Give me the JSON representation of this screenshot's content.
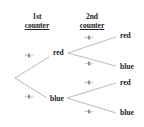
{
  "headers": {
    "first": [
      "1st",
      "counter"
    ],
    "second": [
      "2nd",
      "counter"
    ]
  },
  "nodes": {
    "first_red": "red",
    "first_blue": "blue",
    "red_red": "red",
    "red_blue": "blue",
    "blue_red": "red",
    "blue_blue": "blue"
  },
  "probabilities": {
    "first_red": {
      "num": "3",
      "den": "5"
    },
    "first_blue": {
      "num": "2",
      "den": "5"
    },
    "red_red": {
      "num": "3",
      "den": "5"
    },
    "red_blue": {
      "num": "2",
      "den": "5"
    },
    "blue_red": {
      "num": "3",
      "den": "5"
    },
    "blue_blue": {
      "num": "2",
      "den": "5"
    }
  },
  "colors": {
    "line": "#aaaaaa",
    "text": "#222222"
  }
}
